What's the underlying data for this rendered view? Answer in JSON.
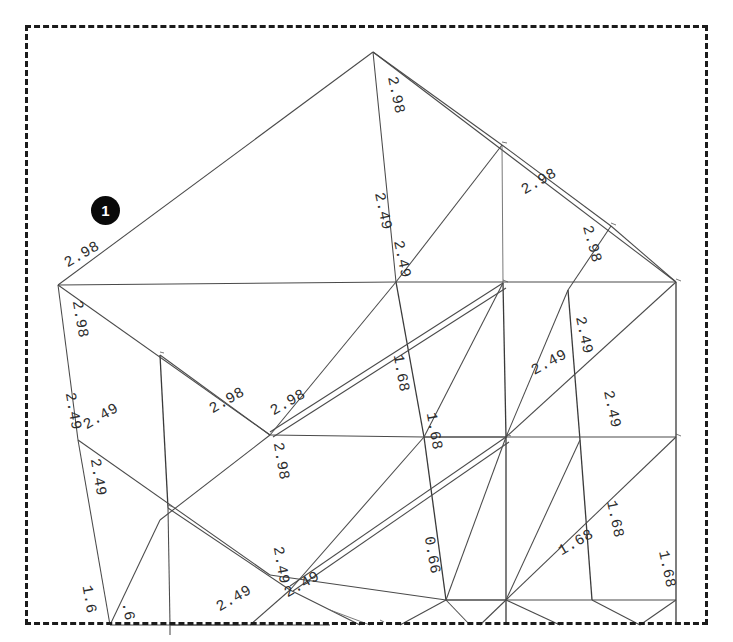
{
  "document": {
    "kind": "isometric-structural-frame-drawing",
    "description": "Scanned axonometric wireframe of a multi-storey structural frame with member dimension labels",
    "background_color": "#ffffff",
    "line_color": "#4a4a4a",
    "text_color": "#2d2d2d"
  },
  "crop_box": {
    "style": "dashed",
    "color": "#1b1b1b",
    "x": 25,
    "y": 25,
    "width": 683,
    "height": 600
  },
  "annotation_badge": {
    "label": "1",
    "shape": "circle",
    "background_color": "#090909",
    "text_color": "#ffffff",
    "x": 105,
    "y": 210,
    "radius": 14
  },
  "caption": {
    "text": "",
    "note": "caption line is cut off at the bottom edge of the screenshot"
  },
  "dimension_values": {
    "unique": [
      "2.98",
      "2.49",
      "1.68",
      "0.66"
    ],
    "counts": {
      "2.98": 9,
      "2.49": 12,
      "1.68": 6,
      "0.66": 1
    }
  },
  "chart_data": {
    "type": "scatter",
    "xlabel": "",
    "ylabel": "",
    "labels": [
      {
        "text": "2.98",
        "x": 392,
        "y": 96,
        "rotation": 78
      },
      {
        "text": "2.49",
        "x": 379,
        "y": 212,
        "rotation": 78
      },
      {
        "text": "2.98",
        "x": 541,
        "y": 185,
        "rotation": -30
      },
      {
        "text": "2.98",
        "x": 588,
        "y": 245,
        "rotation": 75
      },
      {
        "text": "2.98",
        "x": 84,
        "y": 258,
        "rotation": -30
      },
      {
        "text": "2.98",
        "x": 76,
        "y": 320,
        "rotation": 80
      },
      {
        "text": "2.49",
        "x": 398,
        "y": 260,
        "rotation": 78
      },
      {
        "text": "2.49",
        "x": 580,
        "y": 336,
        "rotation": 78
      },
      {
        "text": "2.49",
        "x": 551,
        "y": 366,
        "rotation": -28
      },
      {
        "text": "2.49",
        "x": 608,
        "y": 410,
        "rotation": 78
      },
      {
        "text": "2.49",
        "x": 69,
        "y": 412,
        "rotation": 80
      },
      {
        "text": "2.49",
        "x": 103,
        "y": 420,
        "rotation": -30
      },
      {
        "text": "2.49",
        "x": 94,
        "y": 478,
        "rotation": 80
      },
      {
        "text": "2.98",
        "x": 229,
        "y": 404,
        "rotation": -30
      },
      {
        "text": "2.98",
        "x": 290,
        "y": 406,
        "rotation": -30
      },
      {
        "text": "2.98",
        "x": 277,
        "y": 462,
        "rotation": 80
      },
      {
        "text": "1.68",
        "x": 397,
        "y": 374,
        "rotation": 80
      },
      {
        "text": "1.68",
        "x": 430,
        "y": 432,
        "rotation": 80
      },
      {
        "text": "0.66",
        "x": 428,
        "y": 556,
        "rotation": 80
      },
      {
        "text": "1.68",
        "x": 611,
        "y": 520,
        "rotation": 78
      },
      {
        "text": "1.68",
        "x": 578,
        "y": 546,
        "rotation": -30
      },
      {
        "text": "1.68",
        "x": 663,
        "y": 570,
        "rotation": 78
      },
      {
        "text": "2.49",
        "x": 277,
        "y": 566,
        "rotation": 80
      },
      {
        "text": "2.49",
        "x": 236,
        "y": 602,
        "rotation": -30
      },
      {
        "text": "2.49",
        "x": 304,
        "y": 588,
        "rotation": -30
      },
      {
        "text": "1.6",
        "x": 85,
        "y": 600,
        "rotation": 80
      },
      {
        "text": ".6",
        "x": 124,
        "y": 612,
        "rotation": 80
      }
    ]
  },
  "geometry": {
    "projection": "axonometric",
    "node_label": "joint",
    "member_label": "beam"
  }
}
